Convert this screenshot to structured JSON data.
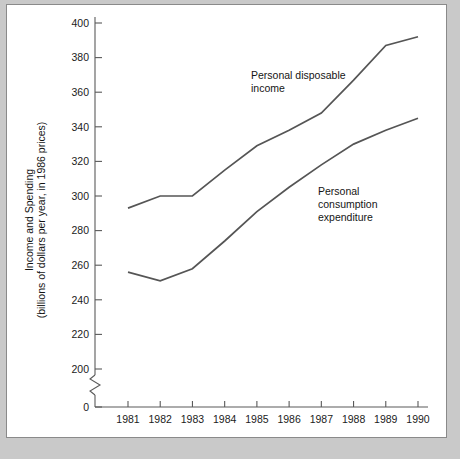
{
  "chart_data": {
    "type": "line",
    "title": "",
    "xlabel": "",
    "ylabel": "Income and Spending",
    "ylabel_line2": "(billions of dollars per year, in 1986 prices)",
    "categories": [
      "1981",
      "1982",
      "1983",
      "1984",
      "1985",
      "1986",
      "1987",
      "1988",
      "1989",
      "1990"
    ],
    "x": [
      1981,
      1982,
      1983,
      1984,
      1985,
      1986,
      1987,
      1988,
      1989,
      1990
    ],
    "ylim": [
      0,
      400
    ],
    "yticks": [
      0,
      200,
      220,
      240,
      260,
      280,
      300,
      320,
      340,
      360,
      380,
      400
    ],
    "ytick_labels": [
      "0",
      "200",
      "220",
      "240",
      "260",
      "280",
      "300",
      "320",
      "340",
      "360",
      "380",
      "400"
    ],
    "axis_break": true,
    "axis_break_between": [
      0,
      200
    ],
    "grid": false,
    "legend_position": "inline-annotations",
    "line_color": "#555555",
    "series": [
      {
        "name": "Personal disposable income",
        "values": [
          293,
          300,
          300,
          315,
          329,
          338,
          348,
          367,
          387,
          392
        ]
      },
      {
        "name": "Personal consumption expenditure",
        "values": [
          256,
          251,
          258,
          274,
          291,
          305,
          318,
          330,
          338,
          345
        ]
      }
    ],
    "annotations": [
      {
        "id": "annotation-disposable-income",
        "lines": [
          "Personal disposable",
          "income"
        ],
        "x_px": 244,
        "y_px": 74
      },
      {
        "id": "annotation-consumption-expenditure",
        "lines": [
          "Personal",
          "consumption",
          "expenditure"
        ],
        "x_px": 311,
        "y_px": 190
      }
    ]
  }
}
